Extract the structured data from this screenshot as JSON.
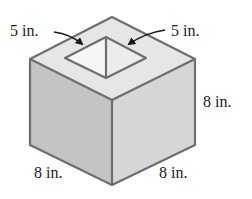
{
  "figure": {
    "type": "cube with square hole through top",
    "labels": {
      "hole_left": "5 in.",
      "hole_right": "5 in.",
      "height": "8 in.",
      "front_left_edge": "8 in.",
      "front_right_edge": "8 in."
    },
    "colors": {
      "top_face": "#e6e6e6",
      "left_face": "#c4c4c4",
      "right_face": "#d6d6d6",
      "hole_left_wall": "#f4f4f4",
      "hole_right_wall": "#ececec",
      "edge": "#6e6e6e",
      "text": "#1a1a1a"
    }
  }
}
